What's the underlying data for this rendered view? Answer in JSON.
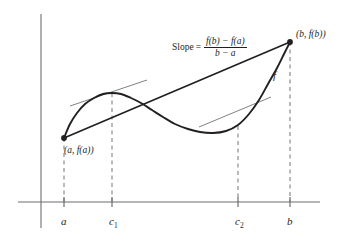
{
  "figure": {
    "axis_color": "#6d6e71",
    "curve_color": "#231f20",
    "secant_color": "#231f20",
    "tangent_color": "#808285",
    "dash_color": "#808285"
  },
  "slope_expression": {
    "label": "Slope",
    "equals": "=",
    "numerator": "f(b) − f(a)",
    "denominator": "b − a"
  },
  "labels": {
    "point_a": "(a, f(a))",
    "point_b": "(b, f(b))",
    "curve": "f"
  },
  "x_ticks": [
    {
      "name": "a",
      "text": "a",
      "sub": ""
    },
    {
      "name": "c1",
      "text": "c",
      "sub": "1"
    },
    {
      "name": "c2",
      "text": "c",
      "sub": "2"
    },
    {
      "name": "b",
      "text": "b",
      "sub": ""
    }
  ],
  "chart_data": {
    "type": "line",
    "xlabel": "",
    "ylabel": "",
    "grid": false,
    "legend": "none",
    "annotations": [
      "Slope = (f(b) − f(a)) / (b − a)",
      "(a, f(a))",
      "(b, f(b))",
      "f"
    ],
    "axis_x_tick_labels": [
      "a",
      "c₁",
      "c₂",
      "b"
    ],
    "series": [
      {
        "name": "f(x)",
        "role": "curve",
        "points": [
          [
            64,
            138
          ],
          [
            70,
            124
          ],
          [
            77,
            113
          ],
          [
            85,
            104
          ],
          [
            94,
            98
          ],
          [
            103,
            94
          ],
          [
            112,
            93
          ],
          [
            121,
            94
          ],
          [
            131,
            98
          ],
          [
            141,
            103
          ],
          [
            152,
            110
          ],
          [
            163,
            117
          ],
          [
            175,
            124
          ],
          [
            188,
            129
          ],
          [
            200,
            132
          ],
          [
            213,
            133
          ],
          [
            226,
            131
          ],
          [
            238,
            125
          ],
          [
            249,
            114
          ],
          [
            259,
            100
          ],
          [
            268,
            84
          ],
          [
            277,
            68
          ],
          [
            284,
            54
          ],
          [
            290,
            42
          ]
        ]
      },
      {
        "name": "secant",
        "role": "secant",
        "points": [
          [
            64,
            138
          ],
          [
            290,
            42
          ]
        ]
      },
      {
        "name": "tangent at c1",
        "role": "tangent",
        "points": [
          [
            70,
            106
          ],
          [
            147,
            80
          ]
        ]
      },
      {
        "name": "tangent at c2",
        "role": "tangent",
        "points": [
          [
            199,
            127
          ],
          [
            271,
            97
          ]
        ]
      }
    ],
    "marked_points": [
      {
        "name": "(a, f(a))",
        "x": 64,
        "y": 138
      },
      {
        "name": "(b, f(b))",
        "x": 290,
        "y": 42
      }
    ],
    "drop_lines": [
      {
        "name": "a",
        "x": 64,
        "y_top": 138,
        "y_bottom": 202
      },
      {
        "name": "c1",
        "x": 112,
        "y_top": 93,
        "y_bottom": 202
      },
      {
        "name": "c2",
        "x": 238,
        "y_top": 126,
        "y_bottom": 202
      },
      {
        "name": "b",
        "x": 290,
        "y_top": 42,
        "y_bottom": 202
      }
    ],
    "axes": {
      "x_axis": {
        "y": 202,
        "x_start": 18,
        "x_end": 320
      },
      "y_axis": {
        "x": 41,
        "y_start": 14,
        "y_end": 228
      }
    }
  }
}
